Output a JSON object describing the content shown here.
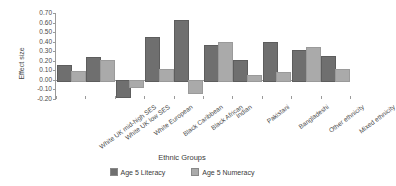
{
  "chart_data": {
    "type": "bar",
    "title": "",
    "xlabel": "Ethnic Groups",
    "ylabel": "Effect size",
    "ylim": [
      -0.2,
      0.7
    ],
    "ytick_step": 0.1,
    "grid": false,
    "legend_position": "bottom",
    "categories": [
      "White UK mid-high SES",
      "White UK low SES",
      "White European",
      "Black Caribbean",
      "Black African",
      "Indian",
      "Pakistani",
      "Bangladeshi",
      "Other ethnicity",
      "Mixed ethnicity"
    ],
    "ytick_labels": [
      "0.70",
      "0.60",
      "0.50",
      "0.40",
      "0.30",
      "0.20",
      "0.10",
      "0.00",
      "-0.10",
      "-0.20"
    ],
    "ytick_values": [
      0.7,
      0.6,
      0.5,
      0.4,
      0.3,
      0.2,
      0.1,
      0.0,
      -0.1,
      -0.2
    ],
    "series": [
      {
        "name": "Age 5 Literacy",
        "color": "#6f6f6f",
        "values": [
          0.16,
          0.24,
          -0.17,
          0.45,
          0.63,
          0.36,
          0.21,
          0.4,
          0.31,
          0.25
        ]
      },
      {
        "name": "Age 5 Numeracy",
        "color": "#aaaaaa",
        "values": [
          0.09,
          0.21,
          -0.06,
          0.11,
          -0.13,
          0.4,
          0.05,
          0.08,
          0.34,
          0.11
        ]
      }
    ]
  }
}
